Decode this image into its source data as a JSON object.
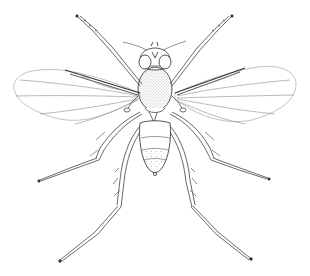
{
  "image": {
    "subject": "insect-illustration",
    "description": "Scientific line drawing of a winged fly, dorsal view",
    "style": "pen-and-ink line art",
    "colors": {
      "background": "#ffffff",
      "ink": "#2a2a2a",
      "ink_light": "#8a8a8a",
      "stipple": "#555555"
    },
    "parts": [
      "head",
      "antennae",
      "compound-eyes",
      "thorax",
      "abdomen",
      "left-wing",
      "right-wing",
      "front-legs",
      "middle-legs",
      "hind-legs"
    ]
  }
}
